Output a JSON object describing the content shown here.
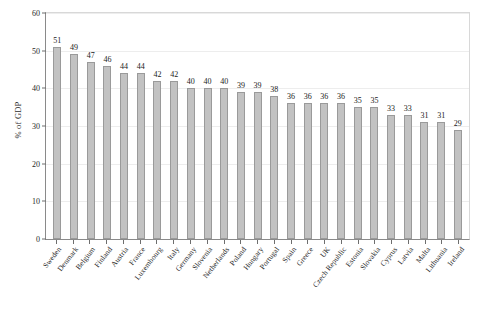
{
  "chart_data": {
    "type": "bar",
    "title": "",
    "xlabel": "",
    "ylabel": "% of GDP",
    "ylim": [
      0,
      60
    ],
    "yticks": [
      0,
      10,
      20,
      30,
      40,
      50,
      60
    ],
    "grid": true,
    "legend": null,
    "bar_color": "#c2c2c2",
    "bar_edge_color": "#9a9a9a",
    "categories": [
      "Sweden",
      "Denmark",
      "Belgium",
      "Finland",
      "Austria",
      "France",
      "Luxembourg",
      "Italy",
      "Germany",
      "Slovenia",
      "Netherlands",
      "Poland",
      "Hungary",
      "Portugal",
      "Spain",
      "Greece",
      "UK",
      "Czech Republic",
      "Estonia",
      "Slovakia",
      "Cyprus",
      "Latvia",
      "Malta",
      "Lithuania",
      "Ireland"
    ],
    "values": [
      51,
      49,
      47,
      46,
      44,
      44,
      42,
      42,
      40,
      40,
      40,
      39,
      39,
      38,
      36,
      36,
      36,
      36,
      35,
      35,
      33,
      33,
      31,
      31,
      29
    ],
    "data_labels": [
      "51",
      "49",
      "47",
      "46",
      "44",
      "44",
      "42",
      "42",
      "40",
      "40",
      "40",
      "39",
      "39",
      "38",
      "36",
      "36",
      "36",
      "36",
      "35",
      "35",
      "33",
      "33",
      "31",
      "31",
      "29"
    ]
  }
}
